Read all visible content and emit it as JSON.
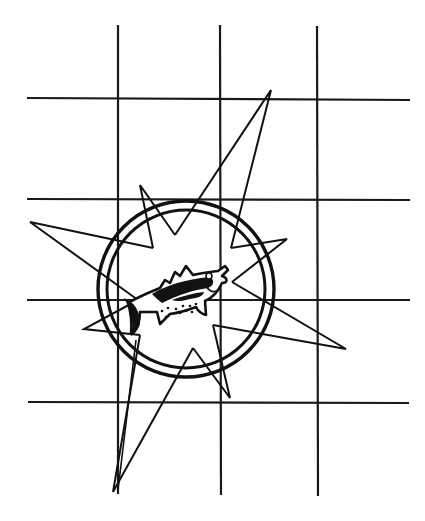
{
  "logo": {
    "description": "Compass rose with fish emblem over grid",
    "colors": {
      "ink": "#111111",
      "background": "#ffffff"
    },
    "grid": {
      "vertical_x": [
        118,
        220,
        317
      ],
      "vertical_y_range": [
        25,
        494
      ],
      "horizontal_y": [
        98,
        199,
        300,
        402
      ],
      "horizontal_x_range": [
        27,
        410
      ]
    },
    "ring": {
      "cx": 186,
      "cy": 289,
      "r_outer": 89,
      "r_inner": 80
    },
    "compass_points": [
      {
        "name": "north-east-large",
        "tip": [
          271,
          90
        ]
      },
      {
        "name": "west-large",
        "tip": [
          30,
          222
        ]
      },
      {
        "name": "east-large",
        "tip": [
          346,
          349
        ]
      },
      {
        "name": "south-large",
        "tip": [
          113,
          492
        ]
      },
      {
        "name": "north-small",
        "tip": [
          140,
          185
        ]
      },
      {
        "name": "north-east-small",
        "tip": [
          287,
          239
        ]
      },
      {
        "name": "south-east-small",
        "tip": [
          230,
          398
        ]
      },
      {
        "name": "south-west-small",
        "tip": [
          84,
          329
        ]
      }
    ],
    "emblem": "fish-icon"
  }
}
